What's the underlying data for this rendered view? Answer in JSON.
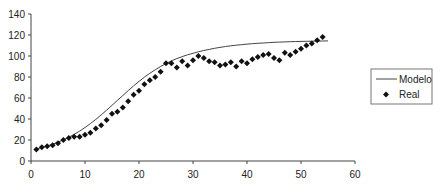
{
  "chart_data": {
    "type": "line",
    "title": "",
    "xlabel": "",
    "ylabel": "",
    "xlim": [
      0,
      60
    ],
    "ylim": [
      0,
      140
    ],
    "x_ticks": [
      0,
      10,
      20,
      30,
      40,
      50,
      60
    ],
    "y_ticks": [
      0,
      20,
      40,
      60,
      80,
      100,
      120,
      140
    ],
    "grid": false,
    "legend_position": "right",
    "series": [
      {
        "name": "Modelo",
        "style": "line",
        "color": "#333333",
        "x": [
          1,
          2,
          3,
          4,
          5,
          6,
          7,
          8,
          9,
          10,
          11,
          12,
          13,
          14,
          15,
          16,
          17,
          18,
          19,
          20,
          21,
          22,
          23,
          24,
          25,
          26,
          27,
          28,
          29,
          30,
          31,
          32,
          33,
          34,
          35,
          36,
          37,
          38,
          39,
          40,
          41,
          42,
          43,
          44,
          45,
          46,
          47,
          48,
          49,
          50,
          51,
          52,
          53,
          54,
          55
        ],
        "values": [
          11.5,
          12.8,
          14.3,
          16.0,
          17.9,
          20.1,
          22.6,
          25.4,
          28.5,
          31.9,
          35.6,
          39.6,
          43.9,
          48.4,
          53.0,
          57.7,
          62.4,
          67.0,
          71.5,
          75.8,
          79.8,
          83.5,
          86.9,
          90.0,
          92.8,
          95.3,
          97.5,
          99.4,
          101.1,
          102.6,
          104.0,
          105.2,
          106.3,
          107.3,
          108.2,
          109.0,
          109.7,
          110.3,
          110.8,
          111.3,
          111.7,
          112.1,
          112.4,
          112.7,
          113.0,
          113.2,
          113.4,
          113.6,
          113.8,
          113.9,
          114.0,
          114.1,
          114.2,
          114.3,
          114.4
        ]
      },
      {
        "name": "Real",
        "style": "markers",
        "marker": "diamond",
        "color": "#111111",
        "x": [
          1,
          2,
          3,
          4,
          5,
          6,
          7,
          8,
          9,
          10,
          11,
          12,
          13,
          14,
          15,
          16,
          17,
          18,
          19,
          20,
          21,
          22,
          23,
          24,
          25,
          26,
          27,
          28,
          29,
          30,
          31,
          32,
          33,
          34,
          35,
          36,
          37,
          38,
          39,
          40,
          41,
          42,
          43,
          44,
          45,
          46,
          47,
          48,
          49,
          50,
          51,
          52,
          53,
          54
        ],
        "values": [
          11,
          13,
          14,
          15,
          17,
          20,
          22,
          23,
          23,
          25,
          27,
          31,
          34,
          39,
          45,
          47,
          51,
          57,
          63,
          67,
          73,
          77,
          80,
          85,
          93,
          93,
          89,
          95,
          91,
          96,
          100,
          98,
          95,
          94,
          91,
          92,
          94,
          90,
          95,
          93,
          97,
          99,
          101,
          102,
          98,
          96,
          103,
          101,
          104,
          107,
          110,
          112,
          115,
          118
        ]
      }
    ]
  },
  "legend": {
    "items": [
      {
        "label": "Modelo",
        "symbol": "line"
      },
      {
        "label": "Real",
        "symbol": "diamond"
      }
    ]
  },
  "colors": {
    "axis": "#444444",
    "model_line": "#444444",
    "markers": "#111111",
    "legend_border": "#777777"
  }
}
